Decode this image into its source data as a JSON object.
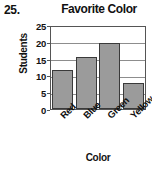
{
  "problem": {
    "number": "25."
  },
  "chart_data": {
    "type": "bar",
    "title": "Favorite Color",
    "xlabel": "Color",
    "ylabel": "Students",
    "categories": [
      "Red",
      "Blue",
      "Green",
      "Yellow"
    ],
    "values": [
      12,
      16,
      20,
      8
    ],
    "ylim": [
      0,
      25
    ],
    "yticks": [
      "0",
      "5",
      "10",
      "15",
      "20",
      "25"
    ],
    "ytick_values": [
      0,
      5,
      10,
      15,
      20,
      25
    ],
    "grid": true,
    "legend": false,
    "bar_color": "#9b9b9b",
    "bar_border_color": "#3a3a3a",
    "text_color": "#111111",
    "grid_color": "#8d8d8d",
    "background": "#ffffff"
  }
}
